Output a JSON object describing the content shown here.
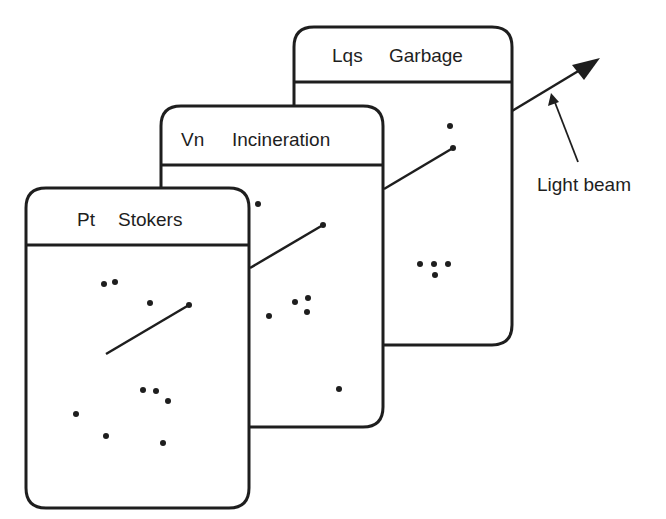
{
  "cards": [
    {
      "name": "back",
      "code": "Lqs",
      "title": "Garbage"
    },
    {
      "name": "middle",
      "code": "Vn",
      "title": "Incineration"
    },
    {
      "name": "front",
      "code": "Pt",
      "title": "Stokers"
    }
  ],
  "annotation": {
    "label": "Light beam"
  },
  "colors": {
    "ink": "#1e1e1e",
    "paper": "#ffffff"
  }
}
